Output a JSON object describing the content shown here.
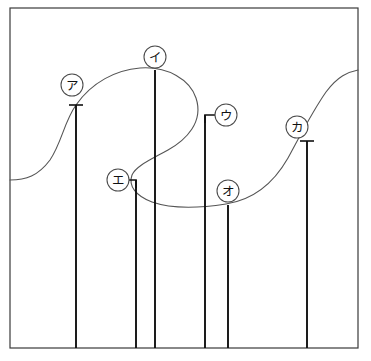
{
  "figure": {
    "title": "",
    "background_color": "#ffffff",
    "frame": {
      "name": "diagram-frame",
      "x": 10,
      "y": 8,
      "width": 348,
      "height": 340,
      "stroke_color": "#3a3a3a"
    },
    "curve": {
      "name": "s-shaped-wave-curve",
      "stroke_color": "#555555",
      "description": "continuous looping S-shaped curve entering at left edge, rising to a peak, folding back on itself, descending to a trough, then rising steeply to exit at the upper right edge",
      "path": "M 10,180 C 26,180 38,176 50,160 C 62,142 64,122 76,105 C 92,82 116,70 140,68 C 168,66 190,80 196,98 C 204,122 186,140 168,150 C 150,160 136,166 132,175 C 128,186 136,196 152,202 C 172,209 200,208 226,204 C 252,200 272,186 288,158 C 300,136 312,112 326,92 C 338,76 348,72 358,70"
    },
    "stems": [
      {
        "name": "stem-a",
        "label": "ア",
        "x": 76,
        "top_y": 105,
        "bottom_y": 348,
        "tick": true,
        "leader": "none",
        "circle_cx": 72,
        "circle_cy": 85
      },
      {
        "name": "stem-i",
        "label": "イ",
        "x": 155,
        "top_y": 70,
        "bottom_y": 348,
        "tick": false,
        "leader": "none",
        "circle_cx": 155,
        "circle_cy": 57
      },
      {
        "name": "stem-u",
        "label": "ウ",
        "x": 205,
        "top_y": 115,
        "bottom_y": 348,
        "tick": false,
        "leader": "right",
        "circle_cx": 226,
        "circle_cy": 115
      },
      {
        "name": "stem-e",
        "label": "エ",
        "x": 136,
        "top_y": 180,
        "bottom_y": 348,
        "tick": false,
        "leader": "left",
        "circle_cx": 118,
        "circle_cy": 180
      },
      {
        "name": "stem-o",
        "label": "オ",
        "x": 228,
        "top_y": 205,
        "bottom_y": 348,
        "tick": false,
        "leader": "none",
        "circle_cx": 228,
        "circle_cy": 191
      },
      {
        "name": "stem-ka",
        "label": "カ",
        "x": 307,
        "top_y": 141,
        "bottom_y": 348,
        "tick": true,
        "leader": "none",
        "circle_cx": 297,
        "circle_cy": 127
      }
    ],
    "labels": {
      "a": "ア",
      "i": "イ",
      "u": "ウ",
      "e": "エ",
      "o": "オ",
      "ka": "カ"
    },
    "colors": {
      "frame_stroke": "#3a3a3a",
      "curve_stroke": "#555555",
      "stem_stroke": "#111111",
      "label_stroke": "#4a4a4a",
      "label_fill": "#ffffff",
      "text": "#111111"
    }
  }
}
